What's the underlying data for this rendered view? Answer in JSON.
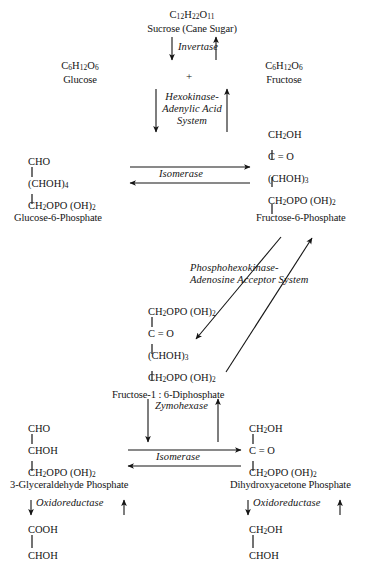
{
  "page": {
    "faint_header": "",
    "background_color": "#ffffff",
    "ink_color": "#141414"
  },
  "nodes": {
    "sucrose": {
      "formula": "C12H22O11",
      "formula_parts": [
        "C",
        "12",
        "H",
        "22",
        "O",
        "11"
      ],
      "name": "Sucrose (Cane Sugar)"
    },
    "glucose": {
      "formula_parts": [
        "C",
        "6",
        "H",
        "12",
        "O",
        "6"
      ],
      "name": "Glucose"
    },
    "fructose": {
      "formula_parts": [
        "C",
        "6",
        "H",
        "12",
        "O",
        "6"
      ],
      "name": "Fructose"
    },
    "plus_sign": "+",
    "glucose6p": {
      "name": "Glucose-6-Phosphate",
      "chain": [
        "CHO",
        "(CHOH)4",
        "CH2OPO (OH)2"
      ]
    },
    "fructose6p": {
      "name": "Fructose-6-Phosphate",
      "chain": [
        "CH2OH",
        "C = O",
        "(CHOH)3",
        "CH2OPO (OH)2"
      ]
    },
    "fructose16dp": {
      "name": "Fructose-1 : 6-Diphosphate",
      "chain": [
        "CH2OPO (OH)2",
        "C = O",
        "(CHOH)3",
        "CH2OPO (OH)2"
      ]
    },
    "glyceraldehyde3p": {
      "name": "3-Glyceraldehyde Phosphate",
      "chain": [
        "CHO",
        "CHOH",
        "CH2OPO (OH)2"
      ]
    },
    "dihydroxyacetonep": {
      "name": "Dihydroxyacetone Phosphate",
      "chain": [
        "CH2OH",
        "C = O",
        "CH2OPO (OH)2"
      ]
    },
    "product_left": {
      "chain": [
        "COOH",
        "CHOH"
      ]
    },
    "product_right": {
      "chain": [
        "CH2OH",
        "CHOH"
      ]
    }
  },
  "enzymes": {
    "invertase": "Invertase",
    "hexokinase": [
      "Hexokinase-",
      "Adenylic Acid",
      "System"
    ],
    "isomerase_top": "Isomerase",
    "phosphohexokinase": [
      "Phosphohexokinase-",
      "Adenosine Acceptor System"
    ],
    "zymohexase": "Zymohexase",
    "isomerase_bottom": "Isomerase",
    "oxidoreductase_left": "Oxidoreductase",
    "oxidoreductase_right": "Oxidoreductase"
  },
  "arrows": {
    "invertase_down": "down-arrow",
    "invertase_up": "up-arrow",
    "hexokinase_down": "down-arrow",
    "hexokinase_up": "up-arrow",
    "isomerase_top_right": "right-arrow",
    "isomerase_top_left": "left-arrow",
    "phosphohexokinase_downleft": "diagonal-down-left-arrow",
    "phosphohexokinase_upright": "diagonal-up-right-arrow",
    "zymohexase_down": "down-arrow",
    "zymohexase_up": "up-arrow",
    "isomerase_bottom_right": "right-arrow",
    "isomerase_bottom_left": "left-arrow",
    "oxidoreductase_left_down": "down-arrow",
    "oxidoreductase_left_up": "up-arrow",
    "oxidoreductase_right_down": "down-arrow",
    "oxidoreductase_right_up": "up-arrow"
  }
}
